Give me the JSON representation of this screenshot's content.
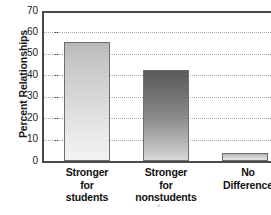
{
  "chart_data": {
    "type": "bar",
    "title": "",
    "xlabel": "",
    "ylabel": "Percent Relationships",
    "categories": [
      "Stronger for students",
      "Stronger for nonstudents",
      "No Difference"
    ],
    "category_lines": [
      [
        "Stronger",
        "for",
        "students"
      ],
      [
        "Stronger",
        "for",
        "nonstudents"
      ],
      [
        "No",
        "Difference"
      ]
    ],
    "values": [
      55.5,
      42.5,
      3.5
    ],
    "ylim": [
      0,
      70
    ],
    "yticks": [
      0,
      10,
      20,
      30,
      40,
      50,
      60,
      70
    ],
    "ytick_labels": [
      "0",
      "10",
      "20",
      "30",
      "40",
      "50",
      "60",
      "70"
    ],
    "grid": true,
    "legend": "none",
    "bar_colors": [
      "#dcdcdc",
      "#7a7a7a",
      "#d4d4d4"
    ],
    "bar_edge_color": "#6e6e6e",
    "axis_color": "#4a4a4a",
    "gridline_color": "#a8a8a8"
  },
  "annotation": {
    "caret": "^"
  }
}
